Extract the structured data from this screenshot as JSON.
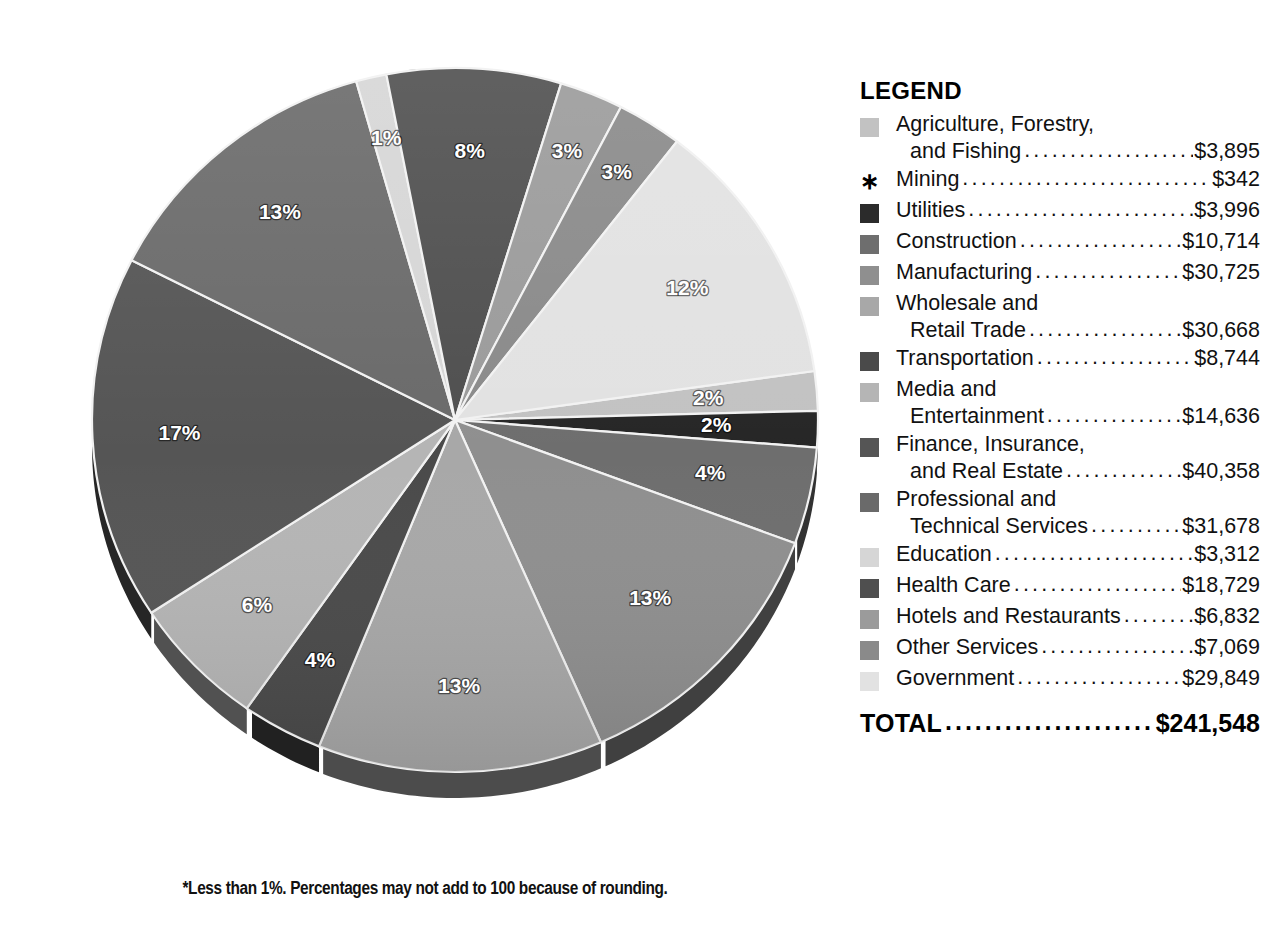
{
  "chart_data": {
    "type": "pie",
    "title": "",
    "units": "millions of dollars",
    "total_label": "TOTAL",
    "total_value": "$241,548",
    "footnote": "*Less than 1%. Percentages may not add to 100 because of rounding.",
    "legend_title": "LEGEND",
    "categories": [
      "Agriculture, Forestry, and Fishing",
      "Mining",
      "Utilities",
      "Construction",
      "Manufacturing",
      "Wholesale and Retail Trade",
      "Transportation",
      "Media and Entertainment",
      "Finance, Insurance, and Real Estate",
      "Professional and Technical Services",
      "Education",
      "Health Care",
      "Hotels and Restaurants",
      "Other Services",
      "Government"
    ],
    "values": [
      3895,
      342,
      3996,
      10714,
      30725,
      30668,
      8744,
      14636,
      40358,
      31678,
      3312,
      18729,
      6832,
      7069,
      29849
    ],
    "percent_labels": [
      "2%",
      "*",
      "2%",
      "4%",
      "13%",
      "13%",
      "4%",
      "6%",
      "17%",
      "13%",
      "1%",
      "8%",
      "3%",
      "3%",
      "12%"
    ],
    "colors": [
      "#c2c2c2",
      "#2b2b2b",
      "#2b2b2b",
      "#6e6e6e",
      "#8f8f8f",
      "#a8a8a8",
      "#4a4a4a",
      "#b5b5b5",
      "#555555",
      "#6a6a6a",
      "#d6d6d6",
      "#4f4f4f",
      "#9b9b9b",
      "#8a8a8a",
      "#e2e2e2"
    ]
  },
  "legend": {
    "title": "LEGEND",
    "leader_dots": "..............................................................",
    "items": [
      {
        "name_line1": "Agriculture, Forestry,",
        "name_line2": "and Fishing",
        "amount": "$3,895",
        "swatch": "#c2c2c2",
        "marker": "swatch",
        "two_line": true
      },
      {
        "name_line1": "Mining",
        "name_line2": "",
        "amount": "$342",
        "swatch": "#2b2b2b",
        "marker": "asterisk",
        "asterisk_glyph": "∗",
        "two_line": false
      },
      {
        "name_line1": "Utilities",
        "name_line2": "",
        "amount": "$3,996",
        "swatch": "#2b2b2b",
        "marker": "swatch",
        "two_line": false
      },
      {
        "name_line1": "Construction",
        "name_line2": "",
        "amount": "$10,714",
        "swatch": "#6e6e6e",
        "marker": "swatch",
        "two_line": false
      },
      {
        "name_line1": "Manufacturing",
        "name_line2": "",
        "amount": "$30,725",
        "swatch": "#8f8f8f",
        "marker": "swatch",
        "two_line": false
      },
      {
        "name_line1": "Wholesale and",
        "name_line2": "Retail Trade",
        "amount": "$30,668",
        "swatch": "#a8a8a8",
        "marker": "swatch",
        "two_line": true
      },
      {
        "name_line1": "Transportation",
        "name_line2": "",
        "amount": "$8,744",
        "swatch": "#4a4a4a",
        "marker": "swatch",
        "two_line": false
      },
      {
        "name_line1": "Media and",
        "name_line2": "Entertainment",
        "amount": "$14,636",
        "swatch": "#b5b5b5",
        "marker": "swatch",
        "two_line": true
      },
      {
        "name_line1": "Finance, Insurance,",
        "name_line2": "and Real Estate",
        "amount": "$40,358",
        "swatch": "#555555",
        "marker": "swatch",
        "two_line": true
      },
      {
        "name_line1": "Professional and",
        "name_line2": "Technical Services",
        "amount": "$31,678",
        "swatch": "#6a6a6a",
        "marker": "swatch",
        "two_line": true
      },
      {
        "name_line1": "Education",
        "name_line2": "",
        "amount": "$3,312",
        "swatch": "#d6d6d6",
        "marker": "swatch",
        "two_line": false
      },
      {
        "name_line1": "Health Care",
        "name_line2": "",
        "amount": "$18,729",
        "swatch": "#4f4f4f",
        "marker": "swatch",
        "two_line": false
      },
      {
        "name_line1": "Hotels and Restaurants",
        "name_line2": "",
        "amount": "$6,832",
        "swatch": "#9b9b9b",
        "marker": "swatch",
        "two_line": false
      },
      {
        "name_line1": "Other Services",
        "name_line2": "",
        "amount": "$7,069",
        "swatch": "#8a8a8a",
        "marker": "swatch",
        "two_line": false
      },
      {
        "name_line1": "Government",
        "name_line2": "",
        "amount": "$29,849",
        "swatch": "#e2e2e2",
        "marker": "swatch",
        "two_line": false
      }
    ],
    "total": {
      "label": "TOTAL",
      "amount": "$241,548"
    }
  },
  "pie": {
    "center_x": 455,
    "center_y": 420,
    "radius_x": 363,
    "radius_y": 352,
    "depth": 26,
    "slices": [
      {
        "label": "2%",
        "start": 352.0,
        "sweep": 6.5,
        "color": "#c2c2c2",
        "name": "agriculture-forestry-fishing",
        "lx": 0.7,
        "ly": 0.0
      },
      {
        "label": "2%",
        "start": 358.5,
        "sweep": 6.0,
        "color": "#262626",
        "name": "utilities",
        "lx": 0.72,
        "ly": 0.0
      },
      {
        "label": "4%",
        "start": 4.5,
        "sweep": 16.0,
        "color": "#6e6e6e",
        "name": "construction",
        "lx": 0.72,
        "ly": 0.0
      },
      {
        "label": "13%",
        "start": 20.5,
        "sweep": 45.8,
        "color": "#8f8f8f",
        "name": "manufacturing",
        "lx": 0.74,
        "ly": 0.0
      },
      {
        "label": "13%",
        "start": 66.3,
        "sweep": 45.7,
        "color": "#a8a8a8",
        "name": "wholesale-retail-trade",
        "lx": 0.76,
        "ly": 0.0
      },
      {
        "label": "4%",
        "start": 112.0,
        "sweep": 13.0,
        "color": "#4a4a4a",
        "name": "transportation",
        "lx": 0.78,
        "ly": 0.0
      },
      {
        "label": "6%",
        "start": 125.0,
        "sweep": 21.8,
        "color": "#b5b5b5",
        "name": "media-entertainment",
        "lx": 0.76,
        "ly": 0.0
      },
      {
        "label": "17%",
        "start": 146.8,
        "sweep": 60.2,
        "color": "#555555",
        "name": "finance-insurance-real-estate",
        "lx": 0.76,
        "ly": 0.0
      },
      {
        "label": "13%",
        "start": 207.0,
        "sweep": 47.2,
        "color": "#6a6a6a",
        "name": "professional-technical-services",
        "lx": 0.76,
        "ly": 0.0
      },
      {
        "label": "1%",
        "start": 254.2,
        "sweep": 4.9,
        "color": "#d6d6d6",
        "name": "education",
        "lx": 0.82,
        "ly": 0.0
      },
      {
        "label": "8%",
        "start": 259.1,
        "sweep": 27.9,
        "color": "#4f4f4f",
        "name": "health-care",
        "lx": 0.76,
        "ly": 0.0
      },
      {
        "label": "3%",
        "start": 287.0,
        "sweep": 10.2,
        "color": "#9b9b9b",
        "name": "hotels-restaurants",
        "lx": 0.82,
        "ly": 0.0
      },
      {
        "label": "3%",
        "start": 297.2,
        "sweep": 10.5,
        "color": "#8a8a8a",
        "name": "other-services",
        "lx": 0.83,
        "ly": 0.0
      },
      {
        "label": "12%",
        "start": 307.7,
        "sweep": 44.3,
        "color": "#e2e2e2",
        "name": "government",
        "lx": 0.74,
        "ly": 0.0
      }
    ]
  },
  "footnote": "*Less than 1%. Percentages may not add to 100 because of rounding."
}
